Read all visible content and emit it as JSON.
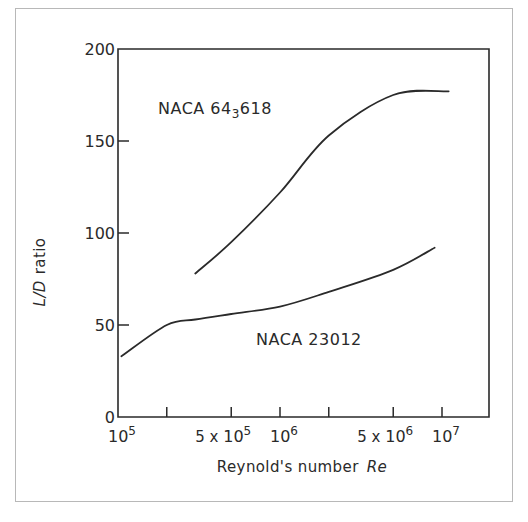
{
  "chart_data": {
    "type": "line",
    "title": "",
    "xlabel": "Reynold's number",
    "xlabel_symbol": "Re",
    "ylabel": "ratio",
    "ylabel_symbol": "L/D",
    "xscale": "log",
    "xlim": [
      100000,
      19000000
    ],
    "ylim": [
      0,
      200
    ],
    "grid": false,
    "legend_position": "inline annotations",
    "y_ticks": [
      0,
      50,
      100,
      150,
      200
    ],
    "y_tick_labels": [
      "0",
      "50",
      "100",
      "150",
      "200"
    ],
    "x_ticks": [
      100000,
      200000,
      500000,
      1000000,
      2000000,
      5000000,
      10000000
    ],
    "x_tick_labels": [
      {
        "base": "10",
        "exp": "5",
        "prefix": ""
      },
      {
        "base": "",
        "exp": "",
        "prefix": ""
      },
      {
        "base": "10",
        "exp": "5",
        "prefix": "5 x "
      },
      {
        "base": "10",
        "exp": "6",
        "prefix": ""
      },
      {
        "base": "",
        "exp": "",
        "prefix": ""
      },
      {
        "base": "10",
        "exp": "6",
        "prefix": "5 x "
      },
      {
        "base": "10",
        "exp": "7",
        "prefix": ""
      }
    ],
    "series": [
      {
        "name": "NACA 64₃618",
        "label_main": "NACA  64",
        "label_sub": "3",
        "label_tail": "618",
        "x": [
          300000,
          500000,
          1000000,
          2000000,
          5000000,
          11000000
        ],
        "values": [
          78,
          95,
          122,
          153,
          175,
          177
        ]
      },
      {
        "name": "NACA 23012",
        "label_main": "NACA  23012",
        "x": [
          105000,
          200000,
          300000,
          500000,
          1000000,
          2000000,
          5000000,
          9000000
        ],
        "values": [
          33,
          50,
          53,
          56,
          60,
          68,
          80,
          92
        ]
      }
    ]
  },
  "colors": {
    "ink": "#2a2a2a",
    "frame": "#b8b8b8",
    "background": "#ffffff"
  }
}
